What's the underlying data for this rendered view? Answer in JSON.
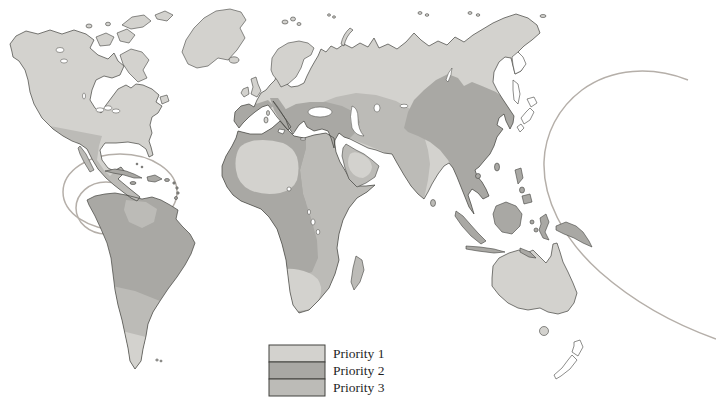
{
  "figure": {
    "type": "world-map"
  },
  "legend": {
    "items": [
      {
        "label": "Priority 1",
        "color": "#d3d2ce"
      },
      {
        "label": "Priority 2",
        "color": "#a9a8a4"
      },
      {
        "label": "Priority 3",
        "color": "#bcbbb7"
      }
    ]
  },
  "map": {
    "colors": {
      "priority1": "#d3d2ce",
      "priority2": "#a9a8a4",
      "priority3": "#bcbbb7",
      "unshaded": "#ffffff",
      "water": "#ffffff",
      "outline": "#42423e",
      "ring": "#b5afa9"
    },
    "regions": [
      {
        "name": "North America",
        "priority": 1
      },
      {
        "name": "Mexico and Central America",
        "priority": 3
      },
      {
        "name": "Caribbean islands",
        "priority": 2
      },
      {
        "name": "Amazonia and northern South America",
        "priority": 2
      },
      {
        "name": "Guianas patch",
        "priority": 3
      },
      {
        "name": "Southern cone of South America",
        "priority": 3
      },
      {
        "name": "Patagonia",
        "priority": 1
      },
      {
        "name": "Europe",
        "priority": 1
      },
      {
        "name": "Mediterranean basin, Turkey and Near East",
        "priority": 2
      },
      {
        "name": "Sahara interior",
        "priority": 1
      },
      {
        "name": "West and Central Africa",
        "priority": 2
      },
      {
        "name": "Northeast and East Africa",
        "priority": 3
      },
      {
        "name": "Southern Africa interior",
        "priority": 1
      },
      {
        "name": "Madagascar",
        "priority": 3
      },
      {
        "name": "Arabian peninsula rim",
        "priority": 3
      },
      {
        "name": "Arabian interior",
        "priority": 1
      },
      {
        "name": "Siberia and northern Eurasia",
        "priority": 1
      },
      {
        "name": "Central Asian steppe, Middle East and India",
        "priority": 3
      },
      {
        "name": "China and East Asia",
        "priority": 2
      },
      {
        "name": "Southeast Asia, Indonesia and New Guinea",
        "priority": 2
      },
      {
        "name": "Australia",
        "priority": 1
      },
      {
        "name": "Japan, New Zealand and Kamchatka",
        "priority": "unshaded"
      }
    ],
    "rings": [
      "Caribbean outer ring",
      "Caribbean inner ring",
      "Western Pacific ring"
    ]
  }
}
